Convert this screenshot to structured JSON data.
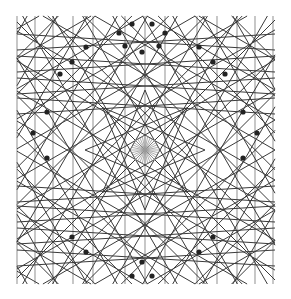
{
  "diagram": {
    "title": "",
    "type": "geometric-line-pattern",
    "center": [
      145,
      150
    ],
    "bounds": {
      "x0": 17,
      "y0": 16,
      "x1": 275,
      "y1": 284
    },
    "stroke_color": "#3a3a3a",
    "light_stroke_color": "#9a9a9a",
    "dot_color": "#222222",
    "vertical_offsets": [
      -128,
      -110,
      -92,
      -72,
      -52,
      -20,
      0,
      20,
      52,
      72,
      92,
      110,
      128
    ],
    "horizontal_offsets": [
      -108,
      -86,
      -64,
      -44,
      44,
      64,
      86,
      108
    ],
    "diagonal_angles_deg": [
      30,
      45,
      60,
      120,
      135,
      150
    ],
    "diagonal_spacing": 26,
    "radial_line_count": 16,
    "radial_length": 14,
    "star_points": 8,
    "star_radius": 60,
    "dots": [
      [
        132,
        24
      ],
      [
        152,
        24
      ],
      [
        119,
        33
      ],
      [
        165,
        33
      ],
      [
        125,
        46
      ],
      [
        159,
        46
      ],
      [
        142,
        52
      ],
      [
        86,
        47
      ],
      [
        72,
        62
      ],
      [
        60,
        74
      ],
      [
        199,
        47
      ],
      [
        213,
        62
      ],
      [
        225,
        74
      ],
      [
        47,
        112
      ],
      [
        33,
        133
      ],
      [
        47,
        158
      ],
      [
        243,
        112
      ],
      [
        257,
        133
      ],
      [
        243,
        158
      ],
      [
        86,
        252
      ],
      [
        72,
        237
      ],
      [
        199,
        252
      ],
      [
        213,
        237
      ],
      [
        132,
        276
      ],
      [
        152,
        276
      ],
      [
        142,
        262
      ]
    ]
  }
}
